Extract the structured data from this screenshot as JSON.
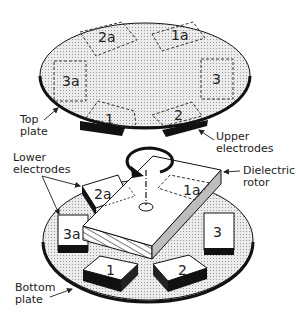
{
  "diagram": {
    "labels": {
      "top_plate": [
        "Top",
        "plate"
      ],
      "upper_electrodes": [
        "Upper",
        "electrodes"
      ],
      "lower_electrodes": [
        "Lower",
        "electrodes"
      ],
      "dielectric_rotor": [
        "Dielectric",
        "rotor"
      ],
      "bottom_plate": [
        "Bottom",
        "plate"
      ]
    },
    "top_electrodes": [
      "1",
      "2",
      "3",
      "1a",
      "2a",
      "3a"
    ],
    "bottom_electrodes": [
      "1",
      "2",
      "3",
      "1a",
      "2a",
      "3a"
    ],
    "colors": {
      "plate_fill": "#d9d9d9",
      "edge": "#111111",
      "rotor_side": "#bdbdbd"
    }
  }
}
